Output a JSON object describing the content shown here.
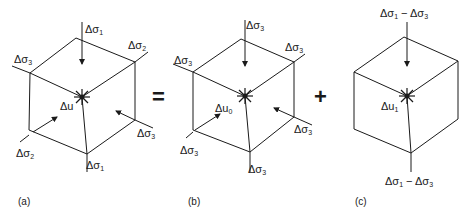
{
  "figure": {
    "panels": [
      {
        "id": "a",
        "caption": "(a)",
        "labels": {
          "top": "Δσ1",
          "upper_right": "Δσ2",
          "upper_left": "Δσ3",
          "pore_pressure": "Δu",
          "lower_right": "Δσ3",
          "lower_left": "Δσ2",
          "bottom": "Δσ1"
        }
      },
      {
        "id": "b",
        "caption": "(b)",
        "labels": {
          "top": "Δσ3",
          "upper_right": "Δσ3",
          "upper_left": "Δσ3",
          "pore_pressure": "Δu0",
          "lower_right": "Δσ3",
          "lower_left": "Δσ3",
          "bottom": "Δσ3"
        }
      },
      {
        "id": "c",
        "caption": "(c)",
        "labels": {
          "top": "Δσ1 − Δσ3",
          "pore_pressure": "Δu1",
          "bottom": "Δσ1 − Δσ3"
        }
      }
    ],
    "operators": {
      "equals": "=",
      "plus": "+"
    }
  }
}
